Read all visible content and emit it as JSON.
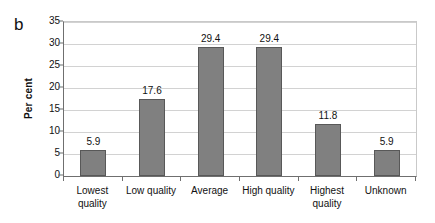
{
  "panel": {
    "letter": "b"
  },
  "chart_data": {
    "type": "bar",
    "title": "",
    "xlabel": "",
    "ylabel": "Per cent",
    "ylim": [
      0,
      35
    ],
    "ytick_step": 5,
    "yticks": [
      "0",
      "5",
      "10",
      "15",
      "20",
      "25",
      "30",
      "35"
    ],
    "grid": true,
    "legend": false,
    "categories": [
      "Lowest\nquality",
      "Low quality",
      "Average",
      "High quality",
      "Highest\nquality",
      "Unknown"
    ],
    "values": [
      5.9,
      17.6,
      29.4,
      29.4,
      11.8,
      5.9
    ],
    "data_labels": [
      "5.9",
      "17.6",
      "29.4",
      "29.4",
      "11.8",
      "5.9"
    ],
    "colors": {
      "bar_fill": "#808080",
      "bar_border": "#585858",
      "gridline": "#d2d2d2",
      "axis": "#6f6f6f",
      "text": "#111111",
      "background": "#ffffff"
    }
  }
}
